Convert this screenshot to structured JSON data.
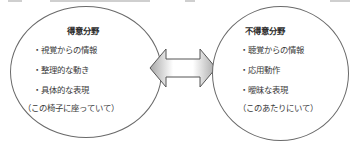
{
  "diagram": {
    "type": "two-ellipse comparison with bidirectional arrow",
    "left": {
      "title": "得意分野",
      "items": [
        "・視覚からの情報",
        "・整理的な動き",
        "・具体的な表現"
      ],
      "example": "（この椅子に座っていて）"
    },
    "right": {
      "title": "不得意分野",
      "items": [
        "・聴覚からの情報",
        "・応用動作",
        "・曖昧な表現"
      ],
      "example": "（このあたりにいて）"
    },
    "connector": {
      "kind": "double-headed-arrow",
      "fill_gradient": [
        "#ffffff",
        "#bdbdbd"
      ],
      "stroke": "#555555"
    },
    "colors": {
      "background": "#ffffff",
      "ellipse_stroke": "#6a6a6a",
      "text": "#3a3a3a"
    }
  }
}
